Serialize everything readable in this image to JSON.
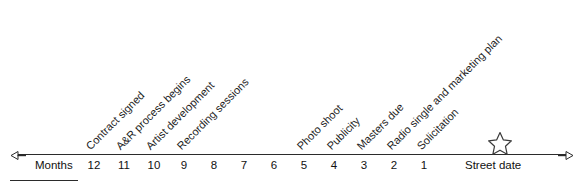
{
  "figure": {
    "name": "record-release-timeline",
    "axis": {
      "unit_label": "Months",
      "start_marker": "left-arrow-icon",
      "end_marker": "right-arrow-icon",
      "end_label": "Street date",
      "end_icon": "star-icon",
      "ticks": [
        "12",
        "11",
        "10",
        "9",
        "8",
        "7",
        "6",
        "5",
        "4",
        "3",
        "2",
        "1"
      ]
    },
    "milestones": [
      {
        "month": "12",
        "label": "Contract signed"
      },
      {
        "month": "11",
        "label": "A&R process begins"
      },
      {
        "month": "10",
        "label": "Artist development"
      },
      {
        "month": "9",
        "label": "Recording sessions"
      },
      {
        "month": "5",
        "label": "Photo shoot"
      },
      {
        "month": "4",
        "label": "Publicity"
      },
      {
        "month": "3",
        "label": "Masters due"
      },
      {
        "month": "2",
        "label": "Radio single and marketing plan"
      },
      {
        "month": "1",
        "label": "Solicitation"
      }
    ],
    "colors": {
      "axis": "#2b2b2b",
      "text": "#111111",
      "background": "#ffffff"
    }
  }
}
